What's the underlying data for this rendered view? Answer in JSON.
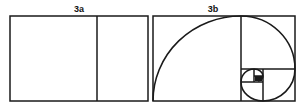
{
  "figures": [
    {
      "id": "3a",
      "label": "3a",
      "description": "Rectangle divided into a square and a smaller rectangle"
    },
    {
      "id": "3b",
      "label": "3b",
      "description": "Golden rectangle with recursively nested squares and golden spiral"
    }
  ],
  "colors": {
    "stroke": "#1a1a1a",
    "background": "#ffffff"
  }
}
